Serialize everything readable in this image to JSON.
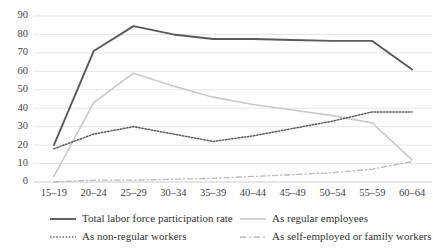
{
  "chart_data": {
    "type": "line",
    "title": "",
    "subtitle": "",
    "xlabel": "",
    "ylabel": "",
    "ylim": [
      0,
      90
    ],
    "ytick_step": 10,
    "grid": true,
    "legend_position": "bottom",
    "categories": [
      "15–19",
      "20–24",
      "25–29",
      "30–34",
      "35–39",
      "40–44",
      "45–49",
      "50–54",
      "55–59",
      "60–64"
    ],
    "ytick_labels": [
      "90",
      "80",
      "70",
      "60",
      "50",
      "40",
      "30",
      "20",
      "10",
      "0"
    ],
    "series": [
      {
        "name": "Total labor force participation rate",
        "style": "solid",
        "color": "#595959",
        "width": 1.9,
        "values": [
          20,
          71,
          84.5,
          80,
          77.5,
          77.5,
          77,
          76.5,
          76.5,
          61
        ]
      },
      {
        "name": "As regular employees",
        "style": "solid",
        "color": "#c9c9c9",
        "width": 1.6,
        "values": [
          3,
          43,
          59,
          52,
          46,
          42,
          39,
          36,
          32,
          12
        ]
      },
      {
        "name": "As non-regular workers",
        "style": "dotted",
        "color": "#5a5a5a",
        "width": 1.5,
        "values": [
          18,
          26,
          30,
          26,
          22,
          25,
          29,
          33,
          38,
          38
        ]
      },
      {
        "name": "As self-employed or family workers",
        "style": "dashdot",
        "color": "#b9b9b9",
        "width": 1.3,
        "values": [
          0,
          1,
          1,
          1.5,
          2,
          3,
          4,
          5,
          7,
          11
        ]
      }
    ]
  },
  "legend": {
    "items": [
      {
        "label": "Total labor force participation rate",
        "marker": "solid-dark-line-swatch"
      },
      {
        "label": "As regular employees",
        "marker": "solid-light-line-swatch"
      },
      {
        "label": "As non-regular workers",
        "marker": "dotted-dark-line-swatch"
      },
      {
        "label": "As self-employed or family workers",
        "marker": "dashdot-light-line-swatch"
      }
    ]
  }
}
